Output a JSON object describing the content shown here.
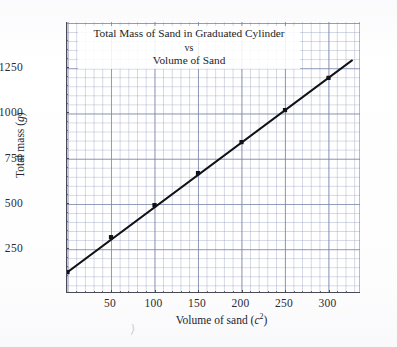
{
  "figure": {
    "paper_color": "#ffffff",
    "grid_color": "#7884a8",
    "axis_color": "#4a4a55",
    "series_color": "#111118",
    "stray_mark": "⟩"
  },
  "chart_data": {
    "type": "line",
    "title": "Total Mass of Sand in Graduated Cylinder\nvs\nVolume of Sand",
    "title_lines": [
      "Total Mass of Sand in Graduated Cylinder",
      "vs",
      "Volume of Sand"
    ],
    "xlabel": "Volume of sand (c2)",
    "xlabel_prefix": "Volume of sand (",
    "xlabel_var": "c",
    "xlabel_exp": "2",
    "xlabel_suffix": ")",
    "ylabel": "Total mass (g)",
    "ylabel_prefix": "Total mass (",
    "ylabel_var": "g",
    "ylabel_suffix": ")",
    "x": [
      0,
      50,
      100,
      150,
      200,
      250,
      300
    ],
    "values": [
      117,
      310,
      487,
      664,
      835,
      1012,
      1190
    ],
    "series": [
      {
        "name": "Total mass of sand in graduated cylinder",
        "x": [
          0,
          50,
          100,
          150,
          200,
          250,
          300
        ],
        "values": [
          117,
          310,
          487,
          664,
          835,
          1012,
          1190
        ]
      }
    ],
    "xticks": [
      50,
      100,
      150,
      200,
      250,
      300
    ],
    "xtick_labels": [
      "50",
      "100",
      "150",
      "200",
      "250",
      "300"
    ],
    "yticks": [
      250,
      500,
      750,
      1000,
      1250
    ],
    "ytick_labels": [
      "250",
      "500",
      "750",
      "1000",
      "1250"
    ],
    "xlim": [
      -15,
      323
    ],
    "ylim": [
      52,
      1450
    ],
    "grid": true,
    "grid_minor": true,
    "minor_x_step": 10,
    "minor_y_step": 50,
    "legend": null,
    "legend_position": "none",
    "marker": "square",
    "line_style": "solid",
    "fit": {
      "slope": 3.57,
      "intercept": 120,
      "extends_beyond_last_point": true
    }
  }
}
